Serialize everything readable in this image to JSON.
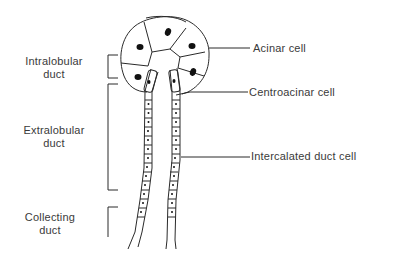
{
  "diagram": {
    "left_labels": {
      "intralobular": {
        "line1": "Intralobular",
        "line2": "duct"
      },
      "extralobular": {
        "line1": "Extralobular",
        "line2": "duct"
      },
      "collecting": {
        "line1": "Collecting",
        "line2": "duct"
      }
    },
    "right_labels": {
      "acinar": "Acinar cell",
      "centroacinar": "Centroacinar cell",
      "intercalated": "Intercalated duct cell"
    },
    "colors": {
      "line": "#2a2a2a",
      "nucleus": "#111111",
      "text": "#3a3a3a",
      "background": "#ffffff"
    }
  }
}
